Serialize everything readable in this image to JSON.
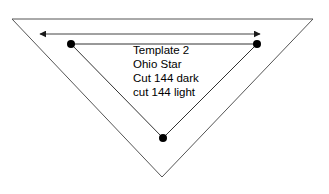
{
  "page": {
    "background_color": "#ffffff",
    "width": 329,
    "height": 194
  },
  "diagram": {
    "outer_triangle": {
      "name": "outer-triangle",
      "stroke_color": "#555555",
      "stroke_width": 1,
      "fill": "none",
      "points": "12,19 313,19 162,177"
    },
    "inner_triangle": {
      "name": "inner-triangle",
      "stroke_color": "#333333",
      "stroke_width": 1,
      "fill": "none",
      "points": "71,44 257,44 163,138"
    },
    "vertex_dots": [
      {
        "name": "vertex-dot-left",
        "cx": 71,
        "cy": 44,
        "r": 4,
        "color": "#000000"
      },
      {
        "name": "vertex-dot-right",
        "cx": 257,
        "cy": 44,
        "r": 4,
        "color": "#000000"
      },
      {
        "name": "vertex-dot-bottom",
        "cx": 163,
        "cy": 138,
        "r": 4,
        "color": "#000000"
      }
    ],
    "dimension_arrow": {
      "name": "dimension-arrow",
      "color": "#444444",
      "stroke_width": 1,
      "x1": 40,
      "y1": 34,
      "x2": 260,
      "y2": 34,
      "double_headed": true
    }
  },
  "labels": {
    "lines": [
      "Template 2",
      "Ohio Star",
      "Cut 144 dark",
      "cut 144 light"
    ]
  }
}
